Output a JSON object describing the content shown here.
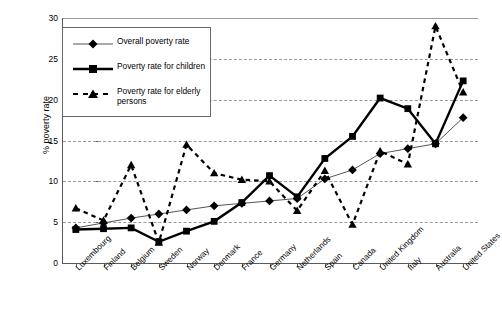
{
  "chart_data": {
    "type": "line",
    "title": "",
    "xlabel": "",
    "ylabel": "% poverty rate",
    "ylim": [
      0,
      30
    ],
    "ytick_values": [
      0,
      5,
      10,
      15,
      20,
      25,
      30
    ],
    "ytick_labels": [
      "0",
      "5",
      "10",
      "15",
      "20",
      "25",
      "30"
    ],
    "grid": "horizontal-dashed",
    "legend_position": "upper-left-inside",
    "categories": [
      "Luxembourg",
      "Finland",
      "Belgium",
      "Sweden",
      "Norway",
      "Denmark",
      "France",
      "Germany",
      "Netherlands",
      "Spain",
      "Canada",
      "United Kingdom",
      "Italy",
      "Australia",
      "United States"
    ],
    "series": [
      {
        "name": "Overall poverty rate",
        "marker": "diamond",
        "line_style": "solid-thin",
        "values": [
          4.3,
          4.9,
          5.5,
          6.0,
          6.5,
          7.0,
          7.3,
          7.6,
          7.9,
          10.3,
          11.4,
          13.4,
          14.0,
          14.6,
          17.8
        ]
      },
      {
        "name": "Poverty rate for children",
        "marker": "square",
        "line_style": "solid-thick",
        "values": [
          4.1,
          4.2,
          4.3,
          2.6,
          3.9,
          5.1,
          7.4,
          10.7,
          8.1,
          12.8,
          15.5,
          20.2,
          18.9,
          14.6,
          22.3
        ]
      },
      {
        "name": "Poverty rate for elderly persons",
        "marker": "triangle",
        "line_style": "dashed",
        "values": [
          6.7,
          5.2,
          12.0,
          2.5,
          14.5,
          11.0,
          10.2,
          10.0,
          6.4,
          11.3,
          4.7,
          13.7,
          12.1,
          29.0,
          20.9
        ]
      }
    ]
  },
  "legend": {
    "entries": [
      {
        "label": "Overall poverty rate"
      },
      {
        "label": "Poverty rate for children"
      },
      {
        "label": "Poverty rate for elderly persons"
      }
    ]
  }
}
